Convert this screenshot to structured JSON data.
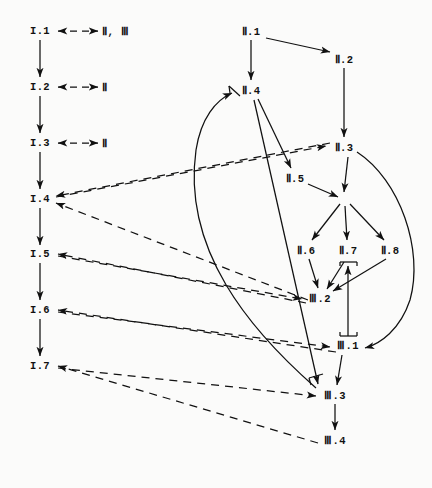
{
  "diagram": {
    "stroke_color": "#111111",
    "background_color": "#fbfbfa",
    "phases": [
      "I",
      "II",
      "III"
    ],
    "nodes": [
      {
        "id": "I.1",
        "label": "I.1",
        "x": 40,
        "y": 31
      },
      {
        "id": "I.2",
        "label": "I.2",
        "x": 40,
        "y": 87
      },
      {
        "id": "I.3",
        "label": "I.3",
        "x": 40,
        "y": 143
      },
      {
        "id": "I.4",
        "label": "I.4",
        "x": 40,
        "y": 199
      },
      {
        "id": "I.5",
        "label": "I.5",
        "x": 40,
        "y": 254
      },
      {
        "id": "I.6",
        "label": "I.6",
        "x": 40,
        "y": 310
      },
      {
        "id": "I.7",
        "label": "I.7",
        "x": 40,
        "y": 366
      },
      {
        "id": "II.1",
        "label": "Ⅱ.1",
        "x": 251,
        "y": 31
      },
      {
        "id": "II.2",
        "label": "Ⅱ.2",
        "x": 344,
        "y": 59
      },
      {
        "id": "II.3",
        "label": "Ⅱ.3",
        "x": 344,
        "y": 147
      },
      {
        "id": "II.4",
        "label": "Ⅱ.4",
        "x": 251,
        "y": 90
      },
      {
        "id": "II.5",
        "label": "Ⅱ.5",
        "x": 295,
        "y": 178
      },
      {
        "id": "II.6",
        "label": "Ⅱ.6",
        "x": 306,
        "y": 250
      },
      {
        "id": "II.7",
        "label": "Ⅱ.7",
        "x": 348,
        "y": 250
      },
      {
        "id": "II.8",
        "label": "Ⅱ.8",
        "x": 390,
        "y": 250
      },
      {
        "id": "III.2",
        "label": "Ⅲ.2",
        "x": 320,
        "y": 298
      },
      {
        "id": "III.1",
        "label": "Ⅲ.1",
        "x": 348,
        "y": 345
      },
      {
        "id": "III.3",
        "label": "Ⅲ.3",
        "x": 335,
        "y": 395
      },
      {
        "id": "III.4",
        "label": "Ⅲ.4",
        "x": 335,
        "y": 440
      },
      {
        "id": "junction",
        "label": "",
        "x": 344,
        "y": 200
      }
    ],
    "cross_refs": [
      {
        "id": "xref-1",
        "label": "Ⅱ, Ⅲ",
        "from": "I.1",
        "x": 104,
        "y": 31
      },
      {
        "id": "xref-2",
        "label": "Ⅱ",
        "from": "I.2",
        "x": 104,
        "y": 87
      },
      {
        "id": "xref-3",
        "label": "Ⅱ",
        "from": "I.3",
        "x": 104,
        "y": 143
      }
    ],
    "solid_edges": [
      {
        "from": "I.1",
        "to": "I.2"
      },
      {
        "from": "I.2",
        "to": "I.3"
      },
      {
        "from": "I.3",
        "to": "I.4"
      },
      {
        "from": "I.4",
        "to": "I.5"
      },
      {
        "from": "I.5",
        "to": "I.6"
      },
      {
        "from": "I.6",
        "to": "I.7"
      },
      {
        "from": "II.1",
        "to": "II.2"
      },
      {
        "from": "II.1",
        "to": "II.4"
      },
      {
        "from": "II.2",
        "to": "II.3"
      },
      {
        "from": "II.4",
        "to": "II.5"
      },
      {
        "from": "II.3",
        "to": "junction"
      },
      {
        "from": "II.5",
        "to": "junction"
      },
      {
        "from": "junction",
        "to": "II.6"
      },
      {
        "from": "junction",
        "to": "II.7"
      },
      {
        "from": "junction",
        "to": "II.8"
      },
      {
        "from": "II.6",
        "to": "III.2"
      },
      {
        "from": "II.7",
        "to": "III.2"
      },
      {
        "from": "II.8",
        "to": "III.2"
      },
      {
        "from": "III.1",
        "to": "II.7",
        "style": "bracketed-vertical"
      },
      {
        "from": "III.1",
        "to": "III.3"
      },
      {
        "from": "III.3",
        "to": "III.4"
      },
      {
        "from": "II.4",
        "to": "III.3",
        "style": "bracketed-long"
      },
      {
        "from": "III.3",
        "to": "II.4",
        "style": "curve-left"
      },
      {
        "from": "II.3",
        "to": "III.1",
        "style": "curve-right"
      }
    ],
    "dashed_edges": [
      {
        "from": "I.1",
        "to": "xref-1",
        "bidirectional": true
      },
      {
        "from": "I.2",
        "to": "xref-2",
        "bidirectional": true
      },
      {
        "from": "I.3",
        "to": "xref-3",
        "bidirectional": true
      },
      {
        "from": "II.3",
        "to": "I.4"
      },
      {
        "from": "III.2",
        "to": "I.4"
      },
      {
        "from": "III.2",
        "to": "I.5"
      },
      {
        "from": "III.3",
        "to": "I.6"
      },
      {
        "from": "III.4",
        "to": "I.7"
      },
      {
        "from": "I.4",
        "to": "II.3"
      },
      {
        "from": "I.5",
        "to": "III.2"
      },
      {
        "from": "I.6",
        "to": "III.1"
      },
      {
        "from": "I.7",
        "to": "III.3"
      }
    ]
  }
}
